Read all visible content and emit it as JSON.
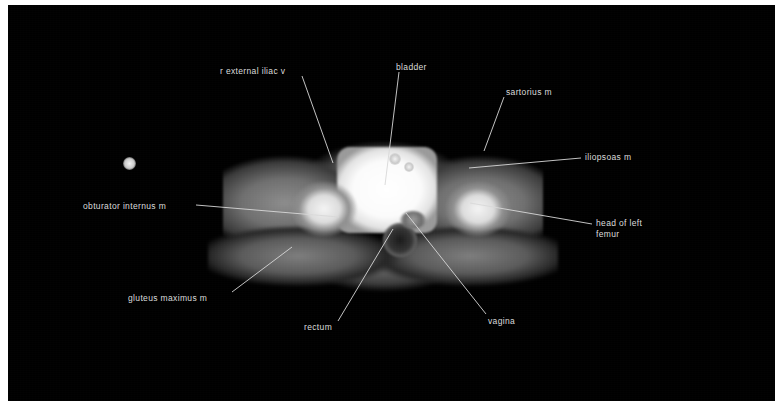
{
  "figure": {
    "type": "axial-pelvic-ct-scan",
    "modality": "CT",
    "plane": "axial",
    "region": "female pelvis",
    "page_background": "#ffffff",
    "image_background": "#000000",
    "label_color": "#dcdcdc",
    "leader_color": "#d8d8d8"
  },
  "annotations": [
    {
      "id": "r-external-iliac-v",
      "label": "r external iliac v",
      "text_x": 220,
      "text_y": 66,
      "leader": {
        "x1": 302,
        "y1": 76,
        "x2": 333,
        "y2": 163
      }
    },
    {
      "id": "bladder",
      "label": "bladder",
      "text_x": 396,
      "text_y": 62,
      "leader": {
        "x1": 399,
        "y1": 72,
        "x2": 385,
        "y2": 185
      }
    },
    {
      "id": "sartorius-m",
      "label": "sartorius m",
      "text_x": 506,
      "text_y": 87,
      "leader": {
        "x1": 504,
        "y1": 97,
        "x2": 484,
        "y2": 151
      }
    },
    {
      "id": "iliopsoas-m",
      "label": "iliopsoas m",
      "text_x": 585,
      "text_y": 152,
      "leader": {
        "x1": 581,
        "y1": 158,
        "x2": 469,
        "y2": 168
      }
    },
    {
      "id": "obturator-internus-m",
      "label": "obturator internus m",
      "text_x": 83,
      "text_y": 201,
      "leader": {
        "x1": 196,
        "y1": 205,
        "x2": 339,
        "y2": 217
      }
    },
    {
      "id": "head-of-left-femur",
      "label": "head of left\nfemur",
      "text_x": 596,
      "text_y": 218,
      "leader": {
        "x1": 592,
        "y1": 224,
        "x2": 470,
        "y2": 203
      }
    },
    {
      "id": "gluteus-maximus-m",
      "label": "gluteus maximus m",
      "text_x": 128,
      "text_y": 293,
      "leader": {
        "x1": 232,
        "y1": 292,
        "x2": 292,
        "y2": 247
      }
    },
    {
      "id": "rectum",
      "label": "rectum",
      "text_x": 304,
      "text_y": 322,
      "leader": {
        "x1": 338,
        "y1": 321,
        "x2": 393,
        "y2": 229
      }
    },
    {
      "id": "vagina",
      "label": "vagina",
      "text_x": 488,
      "text_y": 316,
      "leader": {
        "x1": 486,
        "y1": 314,
        "x2": 406,
        "y2": 213
      }
    }
  ],
  "structures": {
    "bladder": "bladder-structure",
    "rectum": "rectum-structure",
    "vagina": "vagina-structure",
    "femur_right": "femur-right",
    "femur_left": "femur-left",
    "vessels": [
      "r-external-iliac-vessel",
      "l-external-iliac-vessel",
      "l-iliac-vessel-2"
    ]
  }
}
